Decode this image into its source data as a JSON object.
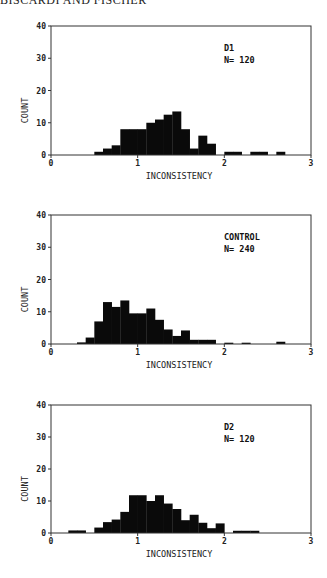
{
  "page": {
    "running_header": "BISCARDI AND FISCHER"
  },
  "chart_data": [
    {
      "type": "bar",
      "title": "D1",
      "annotation": [
        "D1",
        "N= 120"
      ],
      "label": "D1",
      "n_label": "N= 120",
      "xlabel": "INCONSISTENCY",
      "ylabel": "COUNT",
      "xlim": [
        0,
        3
      ],
      "ylim": [
        0,
        40
      ],
      "xticks": [
        "0",
        "1",
        "2",
        "3"
      ],
      "yticks": [
        "0",
        "10",
        "20",
        "30",
        "40"
      ],
      "bin_width": 0.1,
      "bins": [
        {
          "x": 0.5,
          "count": 1
        },
        {
          "x": 0.6,
          "count": 2
        },
        {
          "x": 0.7,
          "count": 3
        },
        {
          "x": 0.8,
          "count": 8
        },
        {
          "x": 0.9,
          "count": 8
        },
        {
          "x": 1.0,
          "count": 8
        },
        {
          "x": 1.1,
          "count": 10
        },
        {
          "x": 1.2,
          "count": 11
        },
        {
          "x": 1.3,
          "count": 12.5
        },
        {
          "x": 1.4,
          "count": 13.5
        },
        {
          "x": 1.5,
          "count": 8
        },
        {
          "x": 1.6,
          "count": 2
        },
        {
          "x": 1.7,
          "count": 6
        },
        {
          "x": 1.8,
          "count": 3.5
        },
        {
          "x": 2.0,
          "count": 1
        },
        {
          "x": 2.1,
          "count": 1
        },
        {
          "x": 2.3,
          "count": 1
        },
        {
          "x": 2.4,
          "count": 1
        },
        {
          "x": 2.6,
          "count": 1
        }
      ],
      "grid": false
    },
    {
      "type": "bar",
      "title": "CONTROL",
      "label": "CONTROL",
      "n_label": "N= 240",
      "xlabel": "INCONSISTENCY",
      "ylabel": "COUNT",
      "xlim": [
        0,
        3
      ],
      "ylim": [
        0,
        40
      ],
      "xticks": [
        "0",
        "1",
        "2",
        "3"
      ],
      "yticks": [
        "0",
        "10",
        "20",
        "30",
        "40"
      ],
      "bin_width": 0.1,
      "bins": [
        {
          "x": 0.3,
          "count": 0.5
        },
        {
          "x": 0.4,
          "count": 2
        },
        {
          "x": 0.5,
          "count": 7
        },
        {
          "x": 0.6,
          "count": 13
        },
        {
          "x": 0.7,
          "count": 11.5
        },
        {
          "x": 0.8,
          "count": 13.5
        },
        {
          "x": 0.9,
          "count": 9.5
        },
        {
          "x": 1.0,
          "count": 9.5
        },
        {
          "x": 1.1,
          "count": 11
        },
        {
          "x": 1.2,
          "count": 7.5
        },
        {
          "x": 1.3,
          "count": 4.5
        },
        {
          "x": 1.4,
          "count": 2.5
        },
        {
          "x": 1.5,
          "count": 4.2
        },
        {
          "x": 1.6,
          "count": 1.3
        },
        {
          "x": 1.7,
          "count": 1.3
        },
        {
          "x": 1.8,
          "count": 1.3
        },
        {
          "x": 2.0,
          "count": 0.4
        },
        {
          "x": 2.2,
          "count": 0.4
        },
        {
          "x": 2.6,
          "count": 0.7
        }
      ],
      "grid": false
    },
    {
      "type": "bar",
      "title": "D2",
      "label": "D2",
      "n_label": "N= 120",
      "xlabel": "INCONSISTENCY",
      "ylabel": "COUNT",
      "xlim": [
        0,
        3
      ],
      "ylim": [
        0,
        40
      ],
      "xticks": [
        "0",
        "1",
        "2",
        "3"
      ],
      "yticks": [
        "0",
        "10",
        "20",
        "30",
        "40"
      ],
      "bin_width": 0.1,
      "bins": [
        {
          "x": 0.2,
          "count": 0.8
        },
        {
          "x": 0.3,
          "count": 0.8
        },
        {
          "x": 0.5,
          "count": 1.7
        },
        {
          "x": 0.6,
          "count": 3.4
        },
        {
          "x": 0.7,
          "count": 4.2
        },
        {
          "x": 0.8,
          "count": 6.6
        },
        {
          "x": 0.9,
          "count": 11.8
        },
        {
          "x": 1.0,
          "count": 11.8
        },
        {
          "x": 1.1,
          "count": 10
        },
        {
          "x": 1.2,
          "count": 11.8
        },
        {
          "x": 1.3,
          "count": 9.2
        },
        {
          "x": 1.4,
          "count": 7.5
        },
        {
          "x": 1.5,
          "count": 4
        },
        {
          "x": 1.6,
          "count": 5.7
        },
        {
          "x": 1.7,
          "count": 3.2
        },
        {
          "x": 1.8,
          "count": 1.5
        },
        {
          "x": 1.9,
          "count": 3
        },
        {
          "x": 2.1,
          "count": 0.7
        },
        {
          "x": 2.2,
          "count": 0.7
        },
        {
          "x": 2.3,
          "count": 0.7
        }
      ],
      "grid": false
    }
  ]
}
